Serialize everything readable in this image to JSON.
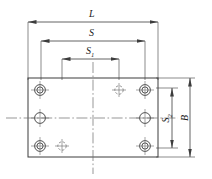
{
  "drawing": {
    "type": "mechanical-engineering-dimension-drawing",
    "subject": "rectangular mounting plate with bolt holes",
    "line_color": "#3c3c3c",
    "centerline_color": "#5a5a5a",
    "background": "#ffffff"
  },
  "dimensions": {
    "length_overall": {
      "label": "L",
      "orientation": "horizontal",
      "position": "top"
    },
    "span_outer": {
      "label": "S",
      "orientation": "horizontal",
      "position": "top"
    },
    "span_inner": {
      "label": "S",
      "subscript": "1",
      "orientation": "horizontal",
      "position": "top"
    },
    "span_vertical": {
      "label": "S",
      "subscript": "2",
      "orientation": "vertical",
      "position": "right"
    },
    "width_overall": {
      "label": "B",
      "orientation": "vertical",
      "position": "right"
    }
  },
  "plate": {
    "outline": {
      "x": 28,
      "y": 78,
      "width": 130,
      "height": 79
    }
  },
  "holes": [
    {
      "name": "hole-top-left",
      "kind": "counterbore",
      "cx": 40,
      "cy": 90
    },
    {
      "name": "hole-mid-left",
      "kind": "plain",
      "cx": 40,
      "cy": 118
    },
    {
      "name": "hole-bottom-left",
      "kind": "counterbore",
      "cx": 40,
      "cy": 146
    },
    {
      "name": "hole-top-right",
      "kind": "counterbore",
      "cx": 145,
      "cy": 90
    },
    {
      "name": "hole-mid-right",
      "kind": "plain",
      "cx": 145,
      "cy": 118
    },
    {
      "name": "hole-bottom-right",
      "kind": "counterbore",
      "cx": 145,
      "cy": 146
    },
    {
      "name": "hole-ref-top",
      "kind": "reference",
      "cx": 119,
      "cy": 90
    },
    {
      "name": "hole-ref-bottom",
      "kind": "reference",
      "cx": 62,
      "cy": 146
    }
  ]
}
